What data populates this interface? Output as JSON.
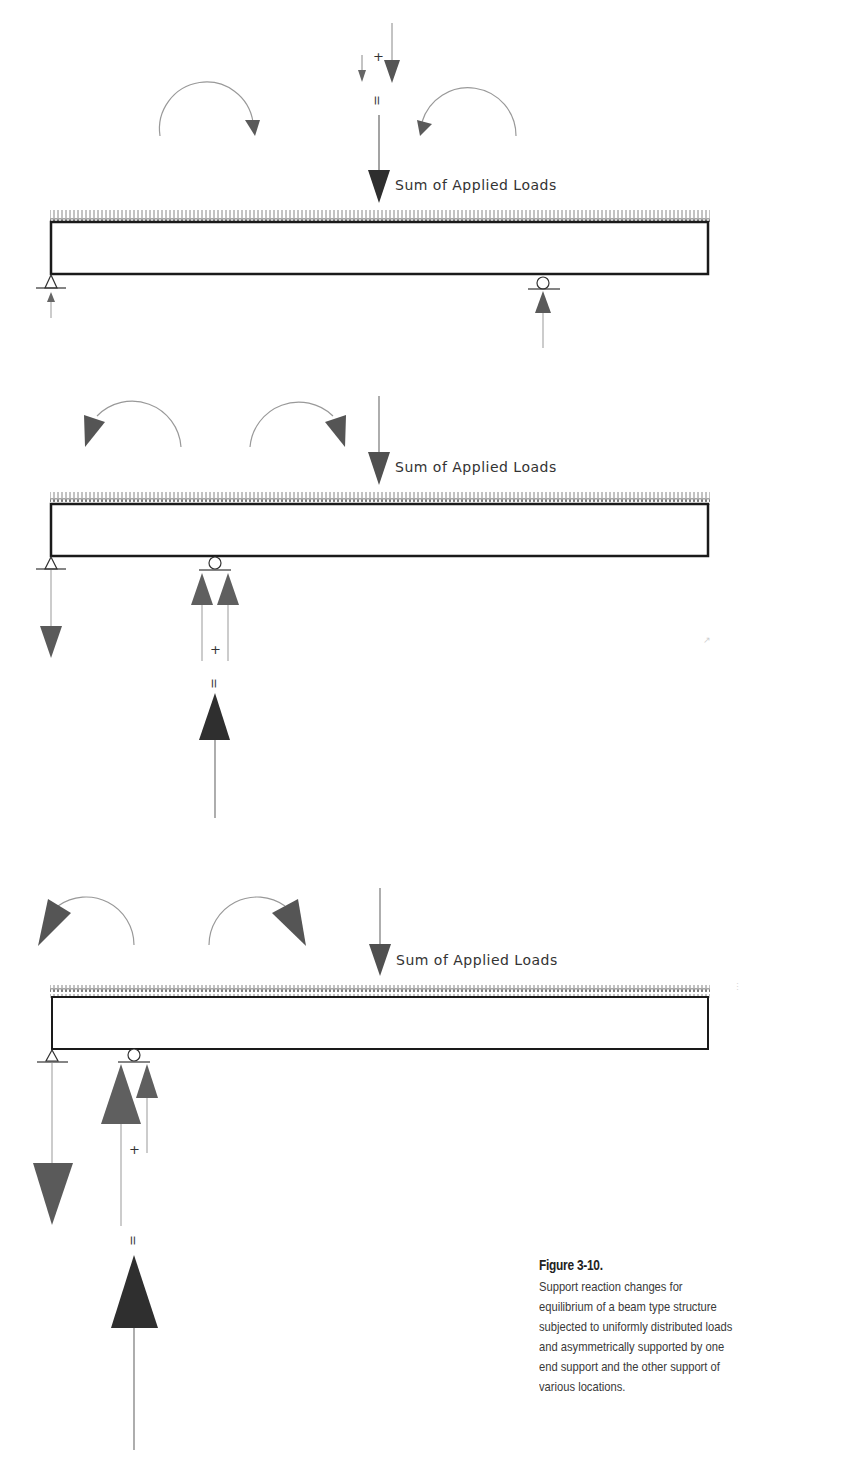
{
  "figure": {
    "number_label": "Figure 3-10.",
    "caption": "Support reaction changes for equilibrium of a beam type structure subjected to uniformly distributed loads and asymmetrically supported by one end support and the other support of various locations.",
    "caption_lines": [
      "Support reaction changes for",
      "equilibrium of a beam type structure",
      "subjected to uniformly distributed loads",
      "and asymmetrically supported by one",
      "end support and the other support of",
      "various locations."
    ]
  },
  "diagrams": [
    {
      "id": "case-1",
      "load_label": "Sum of Applied Loads",
      "plus_symbol": "+",
      "equals_symbol": "=",
      "description": "Supports at left end (pin) and near right (roller); both reactions upward; applied load shown as sum of two downward components"
    },
    {
      "id": "case-2",
      "load_label": "Sum of Applied Loads",
      "plus_symbol": "+",
      "equals_symbol": "=",
      "description": "Roller moved toward left; left reaction downward; roller reaction is sum of two upward components"
    },
    {
      "id": "case-3",
      "load_label": "Sum of Applied Loads",
      "plus_symbol": "+",
      "equals_symbol": "=",
      "description": "Roller closer to left end; larger downward left reaction and larger upward roller reaction"
    }
  ],
  "colors": {
    "beam": "#1a1a1a",
    "load_arrow": "#555555",
    "moment_arrow": "#5c5c5c",
    "resultant": "#333333",
    "thin_line": "#8a8a8a"
  }
}
